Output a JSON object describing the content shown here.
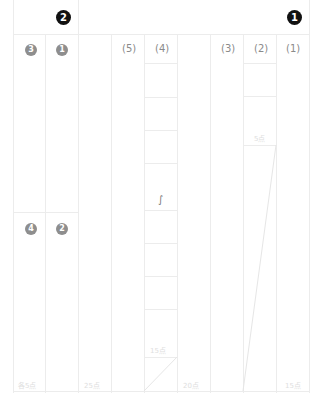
{
  "header": {
    "section_right": "1",
    "section_left": "2"
  },
  "section1": {
    "questions": [
      {
        "label": "(1)",
        "points": "15点"
      },
      {
        "label": "(2)",
        "sub_points": "5点"
      },
      {
        "label": "(3)",
        "points": "20点"
      },
      {
        "label": "(4)",
        "sub_points": "15点",
        "mark": "∫"
      },
      {
        "label": "(5)",
        "points": "25点"
      }
    ]
  },
  "section2": {
    "items": [
      {
        "label": "1"
      },
      {
        "label": "2"
      },
      {
        "label": "3"
      },
      {
        "label": "4"
      }
    ],
    "points": "各5点"
  },
  "colors": {
    "grid_line": "#ececec",
    "badge_header": "#111111",
    "badge_item": "#8e8e8e",
    "label_text": "#8a8a8a",
    "faint_text": "#dedede"
  }
}
